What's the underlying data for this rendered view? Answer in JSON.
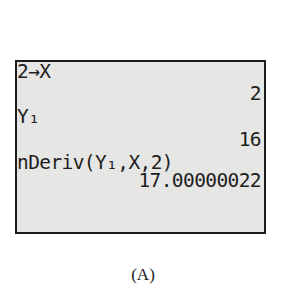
{
  "calculator_screen": {
    "lines": [
      {
        "text": "2→X",
        "align": "left"
      },
      {
        "text": "2",
        "align": "right"
      },
      {
        "text": "Y₁",
        "align": "left"
      },
      {
        "text": "16",
        "align": "right"
      },
      {
        "text": "nDeriv(Y₁,X,2)",
        "align": "left"
      },
      {
        "text": "17.00000022",
        "align": "right"
      }
    ]
  },
  "caption": "(A)"
}
